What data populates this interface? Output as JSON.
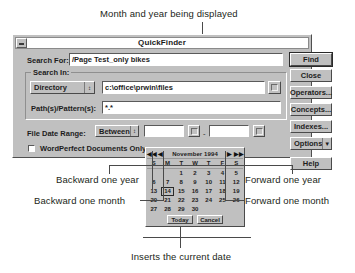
{
  "annotations": {
    "top": "Month and year being displayed",
    "backward_year": "Backward one year",
    "backward_month": "Backward one month",
    "forward_year": "Forward one year",
    "forward_month": "Forward one month",
    "bottom": "Inserts the current date"
  },
  "dialog": {
    "title": "QuickFinder",
    "search_for": {
      "label": "Search For:",
      "value": "/Page Test_only bikes"
    },
    "search_in": {
      "group_label": "Search In:",
      "type_value": "Directory",
      "path_value": "c:\\office\\prwin\\files"
    },
    "patterns": {
      "label": "Path(s)/Pattern(s):",
      "value": "*.*"
    },
    "file_date_range": {
      "label": "File Date Range:",
      "operator": "Between",
      "from_value": "",
      "to_value": "",
      "separator": "-"
    },
    "wp_only": {
      "label": "WordPerfect Documents Only",
      "checked": false
    },
    "buttons": [
      {
        "label": "Find",
        "name": "find-button"
      },
      {
        "label": "Close",
        "name": "close-button"
      },
      {
        "label": "Operators...",
        "name": "operators-button"
      },
      {
        "label": "Concepts...",
        "name": "concepts-button"
      },
      {
        "label": "Indexes...",
        "name": "indexes-button"
      },
      {
        "label": "Options",
        "name": "options-button"
      },
      {
        "label": "Help",
        "name": "help-button"
      }
    ]
  },
  "calendar": {
    "month_year": "November 1994",
    "nav": {
      "prev_year": "◀◀",
      "prev_month": "◀",
      "next_month": "▶",
      "next_year": "▶▶"
    },
    "day_headers": [
      "S",
      "M",
      "T",
      "W",
      "T",
      "F",
      "S"
    ],
    "weeks": [
      [
        "",
        "",
        "1",
        "2",
        "3",
        "4",
        "5"
      ],
      [
        "6",
        "7",
        "8",
        "9",
        "10",
        "11",
        "12"
      ],
      [
        "13",
        "14",
        "15",
        "16",
        "17",
        "18",
        "19"
      ],
      [
        "20",
        "21",
        "22",
        "23",
        "24",
        "25",
        "26"
      ],
      [
        "27",
        "28",
        "29",
        "30",
        "",
        "",
        ""
      ]
    ],
    "selected_day": "14",
    "today_label": "Today",
    "cancel_label": "Cancel"
  },
  "colors": {
    "dialog_face": "#c0c0c0",
    "field_bg": "#ffffff",
    "text": "#1c1c1c",
    "annotation_text": "#231f20"
  }
}
